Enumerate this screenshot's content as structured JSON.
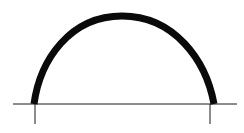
{
  "diagram": {
    "type": "arch-profile",
    "colors": {
      "background": "#ffffff",
      "arch_stroke": "#0a0a0a",
      "line_stroke": "#1a1a1a"
    },
    "arch": {
      "left_foot": [
        34,
        104
      ],
      "right_foot": [
        214,
        104
      ],
      "apex": [
        122,
        16
      ],
      "stroke_width": 7
    },
    "baseline": {
      "x1": 13,
      "x2": 237,
      "y": 104
    },
    "ticks": [
      {
        "x": 35,
        "y1": 104,
        "y2": 124
      },
      {
        "x": 210,
        "y1": 104,
        "y2": 124
      }
    ]
  }
}
